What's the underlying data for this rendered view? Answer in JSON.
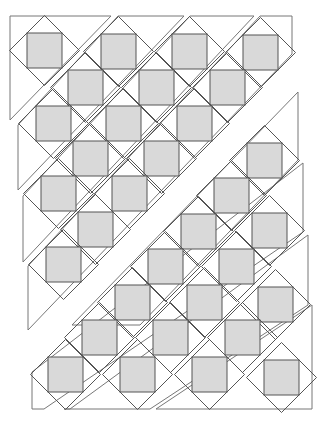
{
  "diagram": {
    "title": "",
    "colors": {
      "background": "#ffffff",
      "square_fill": "#d9d9d9",
      "line": "#555555",
      "strip_outline": "#777777"
    },
    "square_size": 35,
    "diamond_half": 35,
    "upper_squares": [
      [
        27,
        33
      ],
      [
        101,
        34
      ],
      [
        172,
        34
      ],
      [
        243,
        35
      ],
      [
        68,
        70
      ],
      [
        139,
        70
      ],
      [
        210,
        70
      ],
      [
        36,
        106
      ],
      [
        106,
        106
      ],
      [
        177,
        106
      ],
      [
        73,
        141
      ],
      [
        144,
        141
      ],
      [
        41,
        176
      ],
      [
        112,
        176
      ],
      [
        78,
        212
      ],
      [
        46,
        247
      ]
    ],
    "lower_squares": [
      [
        247,
        143
      ],
      [
        214,
        178
      ],
      [
        181,
        214
      ],
      [
        252,
        213
      ],
      [
        148,
        249
      ],
      [
        219,
        249
      ],
      [
        115,
        285
      ],
      [
        187,
        285
      ],
      [
        258,
        287
      ],
      [
        82,
        320
      ],
      [
        153,
        320
      ],
      [
        225,
        320
      ],
      [
        48,
        357
      ],
      [
        120,
        357
      ],
      [
        192,
        357
      ],
      [
        264,
        360
      ]
    ],
    "strips": [
      [
        [
          10,
          16
        ],
        [
          111,
          16
        ],
        [
          10,
          120
        ]
      ],
      [
        [
          118,
          16
        ],
        [
          184,
          16
        ],
        [
          18,
          190
        ],
        [
          18,
          125
        ]
      ],
      [
        [
          190,
          16
        ],
        [
          254,
          16
        ],
        [
          23,
          262
        ],
        [
          23,
          196
        ]
      ],
      [
        [
          260,
          16
        ],
        [
          292,
          16
        ],
        [
          292,
          54
        ],
        [
          28,
          330
        ],
        [
          28,
          266
        ]
      ],
      [
        [
          298,
          92
        ],
        [
          298,
          160
        ],
        [
          140,
          325
        ],
        [
          72,
          325
        ]
      ],
      [
        [
          303,
          163
        ],
        [
          303,
          232
        ],
        [
          44,
          409
        ],
        [
          32,
          409
        ],
        [
          32,
          372
        ]
      ],
      [
        [
          308,
          235
        ],
        [
          308,
          305
        ],
        [
          150,
          409
        ],
        [
          64,
          409
        ],
        [
          70,
          409
        ]
      ],
      [
        [
          312,
          305
        ],
        [
          312,
          409
        ],
        [
          156,
          409
        ]
      ]
    ]
  }
}
